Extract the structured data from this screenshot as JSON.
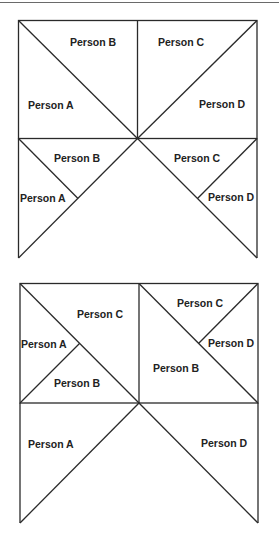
{
  "figures": [
    {
      "name": "figure-1",
      "labels": {
        "top_left_upper": "Person  B",
        "top_left_lower": "Person A",
        "top_right_upper": "Person  C",
        "top_right_lower": "Person D",
        "bottom_left_upper": "Person  B",
        "bottom_left_lower": "Person A",
        "bottom_right_upper": "Person  C",
        "bottom_right_lower": "Person D"
      }
    },
    {
      "name": "figure-2",
      "labels": {
        "top_left_upper": "Person  C",
        "top_left_left": "Person A",
        "top_left_lower": "Person  B",
        "top_right_upper": "Person  C",
        "top_right_right": "Person D",
        "top_right_lower": "Person  B",
        "bottom_left": "Person A",
        "bottom_right": "Person D"
      }
    }
  ],
  "colors": {
    "line": "#2a2a2a",
    "text": "#222222",
    "background": "#ffffff"
  }
}
